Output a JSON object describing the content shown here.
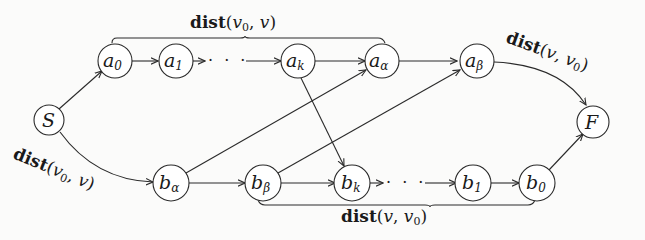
{
  "diagram": {
    "type": "directed-graph",
    "nodes": {
      "S": {
        "base": "S",
        "sub": ""
      },
      "a0": {
        "base": "a",
        "sub": "0"
      },
      "a1": {
        "base": "a",
        "sub": "1"
      },
      "ak": {
        "base": "a",
        "sub": "k"
      },
      "aalpha": {
        "base": "a",
        "sub": "α"
      },
      "abeta": {
        "base": "a",
        "sub": "β"
      },
      "balpha": {
        "base": "b",
        "sub": "α"
      },
      "bbeta": {
        "base": "b",
        "sub": "β"
      },
      "bk": {
        "base": "b",
        "sub": "k"
      },
      "b1": {
        "base": "b",
        "sub": "1"
      },
      "b0": {
        "base": "b",
        "sub": "0"
      },
      "F": {
        "base": "F",
        "sub": ""
      }
    },
    "edges": [
      [
        "S",
        "a0"
      ],
      [
        "a0",
        "a1"
      ],
      [
        "a1",
        "ak"
      ],
      [
        "ak",
        "aalpha"
      ],
      [
        "aalpha",
        "abeta"
      ],
      [
        "abeta",
        "F"
      ],
      [
        "S",
        "balpha"
      ],
      [
        "balpha",
        "bbeta"
      ],
      [
        "bbeta",
        "bk"
      ],
      [
        "bk",
        "b1"
      ],
      [
        "b1",
        "b0"
      ],
      [
        "b0",
        "F"
      ],
      [
        "ak",
        "bk"
      ],
      [
        "balpha",
        "aalpha"
      ],
      [
        "bbeta",
        "abeta"
      ]
    ],
    "ellipsis": "· · ·",
    "labels": {
      "top_brace": {
        "fn": "dist",
        "open": "(",
        "arg1": "v",
        "arg1_sub": "0",
        "sep": ", ",
        "arg2": "v",
        "arg2_sub": "",
        "close": ")"
      },
      "bottom_brace": {
        "fn": "dist",
        "open": "(",
        "arg1": "v",
        "arg1_sub": "",
        "sep": ", ",
        "arg2": "v",
        "arg2_sub": "0",
        "close": ")"
      },
      "s_to_balpha": {
        "fn": "dist",
        "open": "(",
        "arg1": "v",
        "arg1_sub": "0",
        "sep": ", ",
        "arg2": "v",
        "arg2_sub": "",
        "close": ")"
      },
      "abeta_to_f": {
        "fn": "dist",
        "open": "(",
        "arg1": "v",
        "arg1_sub": "",
        "sep": ", ",
        "arg2": "v",
        "arg2_sub": "0",
        "close": ")"
      }
    }
  }
}
